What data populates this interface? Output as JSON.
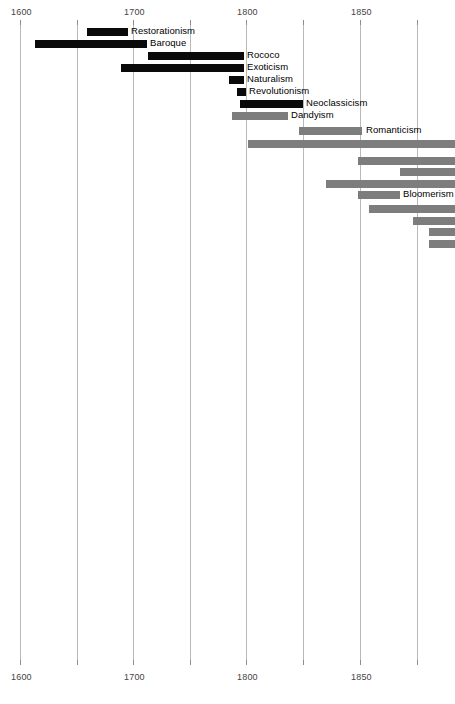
{
  "chart_data": {
    "type": "bar",
    "orientation": "horizontal",
    "subtype": "timeline-gantt",
    "title": "",
    "xlabel": "",
    "ylabel": "",
    "xlim": [
      1582,
      1966
    ],
    "grid": true,
    "legend": "none",
    "axis": {
      "top_ticks": [
        {
          "value": 1600,
          "label": "1600",
          "x": 20
        },
        {
          "value": 1650,
          "label": "",
          "x": 77
        },
        {
          "value": 1700,
          "label": "1700",
          "x": 133
        },
        {
          "value": 1750,
          "label": "",
          "x": 190
        },
        {
          "value": 1800,
          "label": "1800",
          "x": 246
        },
        {
          "value": 1850,
          "label": "",
          "x": 303
        },
        {
          "value": 1850,
          "label": "1850",
          "x": 360
        },
        {
          "value": 1900,
          "label": "",
          "x": 417
        }
      ],
      "bottom_ticks": [
        {
          "value": 1600,
          "label": "1600",
          "x": 20
        },
        {
          "value": 1650,
          "label": "",
          "x": 77
        },
        {
          "value": 1700,
          "label": "1700",
          "x": 133
        },
        {
          "value": 1750,
          "label": "",
          "x": 190
        },
        {
          "value": 1800,
          "label": "1800",
          "x": 246
        },
        {
          "value": 1850,
          "label": "",
          "x": 303
        },
        {
          "value": 1850,
          "label": "1850",
          "x": 360
        },
        {
          "value": 1900,
          "label": "",
          "x": 417
        }
      ],
      "gridline_x": [
        20,
        77,
        133,
        190,
        246,
        303,
        360,
        417
      ],
      "tick_label_texts": [
        "1600",
        "1700",
        "1800",
        "1850"
      ]
    },
    "categories": [
      "Restorationism",
      "Baroque",
      "Rococo",
      "Exoticism",
      "Naturalism",
      "Revolutionism",
      "Neoclassicism",
      "Dandyism",
      "Romanticism",
      "",
      "",
      "",
      "",
      "Bloomerism",
      "",
      "",
      "",
      ""
    ],
    "bars": [
      {
        "label": "Restorationism",
        "color": "dark",
        "x": 87,
        "w": 41,
        "y": 28,
        "label_x": 131,
        "label_y": 26,
        "start_year": 1659,
        "end_year": 1695
      },
      {
        "label": "Baroque",
        "color": "dark",
        "x": 35,
        "w": 112,
        "y": 40,
        "label_x": 150,
        "label_y": 38,
        "start_year": 1613,
        "end_year": 1712
      },
      {
        "label": "Rococo",
        "color": "dark",
        "x": 148,
        "w": 96,
        "y": 52,
        "label_x": 247,
        "label_y": 50,
        "start_year": 1713,
        "end_year": 1798
      },
      {
        "label": "Exoticism",
        "color": "dark",
        "x": 121,
        "w": 123,
        "y": 64,
        "label_x": 247,
        "label_y": 62,
        "start_year": 1689,
        "end_year": 1798
      },
      {
        "label": "Naturalism",
        "color": "dark",
        "x": 229,
        "w": 15,
        "y": 76,
        "label_x": 247,
        "label_y": 74,
        "start_year": 1785,
        "end_year": 1798
      },
      {
        "label": "Revolutionism",
        "color": "dark",
        "x": 237,
        "w": 9,
        "y": 88,
        "label_x": 249,
        "label_y": 86,
        "start_year": 1792,
        "end_year": 1800
      },
      {
        "label": "Neoclassicism",
        "color": "dark",
        "x": 240,
        "w": 63,
        "y": 100,
        "label_x": 306,
        "label_y": 98,
        "start_year": 1794,
        "end_year": 1850
      },
      {
        "label": "Dandyism",
        "color": "gray",
        "x": 232,
        "w": 56,
        "y": 112,
        "label_x": 291,
        "label_y": 110,
        "start_year": 1787,
        "end_year": 1837
      },
      {
        "label": "Romanticism",
        "color": "gray",
        "x": 299,
        "w": 63,
        "y": 127,
        "label_x": 366,
        "label_y": 125,
        "start_year": 1846,
        "end_year": 1902
      },
      {
        "label": "",
        "color": "gray",
        "x": 248,
        "w": 207,
        "y": 140,
        "label_x": 0,
        "label_y": 0,
        "start_year": 1801,
        "end_year": 1984
      },
      {
        "label": "",
        "color": "gray",
        "x": 358,
        "w": 97,
        "y": 157,
        "label_x": 0,
        "label_y": 0,
        "start_year": 1898,
        "end_year": 1984
      },
      {
        "label": "",
        "color": "gray",
        "x": 400,
        "w": 55,
        "y": 168,
        "label_x": 0,
        "label_y": 0,
        "start_year": 1935,
        "end_year": 1984
      },
      {
        "label": "",
        "color": "gray",
        "x": 326,
        "w": 129,
        "y": 180,
        "label_x": 0,
        "label_y": 0,
        "start_year": 1870,
        "end_year": 1984
      },
      {
        "label": "Bloomerism",
        "color": "gray",
        "x": 358,
        "w": 42,
        "y": 191,
        "label_x": 403,
        "label_y": 189,
        "start_year": 1898,
        "end_year": 1935
      },
      {
        "label": "",
        "color": "gray",
        "x": 369,
        "w": 86,
        "y": 205,
        "label_x": 0,
        "label_y": 0,
        "start_year": 1908,
        "end_year": 1984
      },
      {
        "label": "",
        "color": "gray",
        "x": 413,
        "w": 42,
        "y": 217,
        "label_x": 0,
        "label_y": 0,
        "start_year": 1947,
        "end_year": 1984
      },
      {
        "label": "",
        "color": "gray",
        "x": 429,
        "w": 26,
        "y": 228,
        "label_x": 0,
        "label_y": 0,
        "start_year": 1961,
        "end_year": 1984
      },
      {
        "label": "",
        "color": "gray",
        "x": 429,
        "w": 26,
        "y": 240,
        "label_x": 0,
        "label_y": 0,
        "start_year": 1961,
        "end_year": 1984
      }
    ],
    "colors": {
      "bar_dark": "#0a0a0a",
      "bar_gray": "#7d7d7d",
      "gridline": "#b9b9b9",
      "tick_text": "#444444",
      "label_text": "#000000",
      "background": "#ffffff"
    }
  }
}
